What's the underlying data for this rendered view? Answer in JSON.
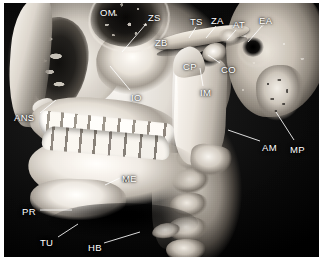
{
  "figure": {
    "modality": "3D CT volume rendering",
    "view": "lateral skull (right side)",
    "background_color": "#000000",
    "page_color": "#ffffff",
    "label_color": "#ffffff"
  },
  "labels": [
    {
      "id": "om",
      "text": "OM",
      "x": 100,
      "y": 8,
      "leader": null
    },
    {
      "id": "zs",
      "text": "ZS",
      "x": 148,
      "y": 13,
      "leader": {
        "x1": 146,
        "y1": 24,
        "x2": 122,
        "y2": 52
      }
    },
    {
      "id": "zb",
      "text": "ZB",
      "x": 155,
      "y": 38,
      "leader": null
    },
    {
      "id": "ts",
      "text": "TS",
      "x": 190,
      "y": 17,
      "leader": {
        "x1": 196,
        "y1": 27,
        "x2": 189,
        "y2": 38
      }
    },
    {
      "id": "za",
      "text": "ZA",
      "x": 211,
      "y": 16,
      "leader": {
        "x1": 216,
        "y1": 26,
        "x2": 206,
        "y2": 38
      }
    },
    {
      "id": "at",
      "text": "AT",
      "x": 233,
      "y": 20,
      "leader": {
        "x1": 236,
        "y1": 30,
        "x2": 227,
        "y2": 40
      }
    },
    {
      "id": "ea",
      "text": "EA",
      "x": 259,
      "y": 16,
      "leader": {
        "x1": 262,
        "y1": 26,
        "x2": 248,
        "y2": 42
      }
    },
    {
      "id": "cp",
      "text": "CP",
      "x": 183,
      "y": 62,
      "leader": null
    },
    {
      "id": "co",
      "text": "CO",
      "x": 221,
      "y": 65,
      "leader": {
        "x1": 220,
        "y1": 63,
        "x2": 208,
        "y2": 55
      }
    },
    {
      "id": "im",
      "text": "IM",
      "x": 200,
      "y": 88,
      "leader": {
        "x1": 203,
        "y1": 86,
        "x2": 200,
        "y2": 68
      }
    },
    {
      "id": "io",
      "text": "IO",
      "x": 131,
      "y": 93,
      "leader": {
        "x1": 130,
        "y1": 90,
        "x2": 110,
        "y2": 66
      }
    },
    {
      "id": "ans",
      "text": "ANS",
      "x": 14,
      "y": 113,
      "leader": {
        "x1": 40,
        "y1": 113,
        "x2": 56,
        "y2": 100
      }
    },
    {
      "id": "am",
      "text": "AM",
      "x": 262,
      "y": 143,
      "leader": {
        "x1": 260,
        "y1": 141,
        "x2": 228,
        "y2": 130
      }
    },
    {
      "id": "mp",
      "text": "MP",
      "x": 290,
      "y": 145,
      "leader": {
        "x1": 294,
        "y1": 140,
        "x2": 276,
        "y2": 112
      }
    },
    {
      "id": "me",
      "text": "ME",
      "x": 122,
      "y": 174,
      "leader": {
        "x1": 120,
        "y1": 178,
        "x2": 105,
        "y2": 185
      }
    },
    {
      "id": "pr",
      "text": "PR",
      "x": 22,
      "y": 207,
      "leader": {
        "x1": 40,
        "y1": 210,
        "x2": 72,
        "y2": 210
      }
    },
    {
      "id": "tu",
      "text": "TU",
      "x": 40,
      "y": 238,
      "leader": {
        "x1": 58,
        "y1": 237,
        "x2": 78,
        "y2": 224
      }
    },
    {
      "id": "hb",
      "text": "HB",
      "x": 88,
      "y": 243,
      "leader": {
        "x1": 104,
        "y1": 243,
        "x2": 140,
        "y2": 232
      }
    }
  ]
}
